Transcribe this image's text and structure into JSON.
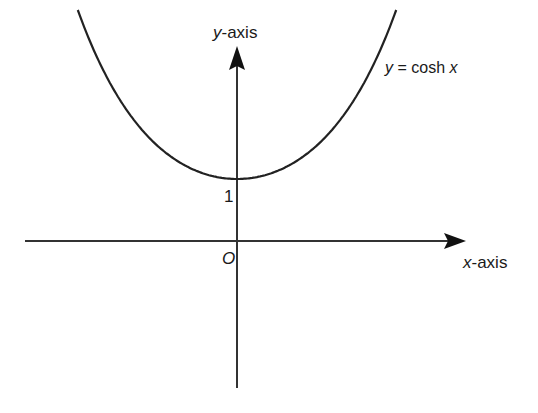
{
  "chart_data": {
    "type": "line",
    "title": "",
    "xlabel": "x-axis",
    "ylabel": "y-axis",
    "series": [
      {
        "name": "y = cosh x",
        "function": "cosh(x)",
        "x": [
          -2,
          -1.5,
          -1,
          -0.5,
          0,
          0.5,
          1,
          1.5,
          2
        ],
        "values": [
          3.762,
          2.352,
          1.543,
          1.128,
          1.0,
          1.128,
          1.543,
          2.352,
          3.762
        ]
      }
    ],
    "annotations": [
      {
        "text": "1",
        "at": [
          0,
          1
        ],
        "meaning": "y-intercept"
      },
      {
        "text": "O",
        "at": [
          0,
          0
        ],
        "meaning": "origin"
      }
    ],
    "grid": false,
    "legend": "none",
    "xlim": [
      -2.4,
      2.4
    ],
    "ylim": [
      -1.6,
      4.0
    ]
  },
  "labels": {
    "y_axis_var": "y",
    "y_axis_suffix": "-axis",
    "x_axis_var": "x",
    "x_axis_suffix": "-axis",
    "curve_y": "y",
    "curve_eq": " = cosh ",
    "curve_x": "x",
    "intercept": "1",
    "origin": "O"
  },
  "colors": {
    "ink": "#1a1a1a",
    "background": "#ffffff"
  }
}
